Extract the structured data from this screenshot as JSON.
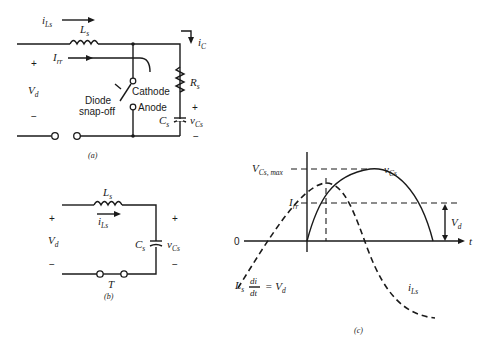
{
  "circuit_a": {
    "caption": "(a)",
    "current_iLs": "i",
    "current_iLs_sub": "Ls",
    "inductor": "L",
    "inductor_sub": "s",
    "current_irr": "I",
    "current_irr_sub": "rr",
    "current_ic": "i",
    "current_ic_sub": "C",
    "source": "V",
    "source_sub": "d",
    "plus": "+",
    "minus": "−",
    "diode_label_1": "Diode",
    "diode_label_2": "snap-off",
    "cathode": "Cathode",
    "anode": "Anode",
    "resistor": "R",
    "resistor_sub": "s",
    "capacitor": "C",
    "capacitor_sub": "s",
    "cap_voltage": "v",
    "cap_voltage_sub": "Cs"
  },
  "circuit_b": {
    "caption": "(b)",
    "inductor": "L",
    "inductor_sub": "s",
    "current": "i",
    "current_sub": "Ls",
    "source": "V",
    "source_sub": "d",
    "capacitor": "C",
    "capacitor_sub": "s",
    "cap_voltage": "v",
    "cap_voltage_sub": "Cs",
    "switch": "T",
    "plus": "+",
    "minus": "−"
  },
  "waveform_c": {
    "caption": "(c)",
    "vmax_label": "V",
    "vmax_sub": "Cs, max",
    "irr_label": "I",
    "irr_sub": "rr",
    "zero": "0",
    "t_axis": "t",
    "vd_label": "V",
    "vd_sub": "d",
    "vcs_curve": "v",
    "vcs_sub": "Cs",
    "ils_curve": "i",
    "ils_sub": "Ls",
    "eq_L": "L",
    "eq_L_sub": "s",
    "eq_num": "di",
    "eq_den": "dt",
    "eq_rhs": "= V",
    "eq_rhs_sub": "d"
  }
}
